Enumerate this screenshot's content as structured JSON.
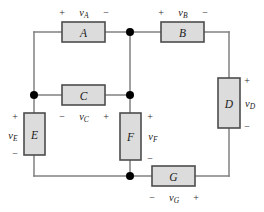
{
  "diagram": {
    "type": "circuit-schematic",
    "background_color": "#ffffff",
    "wire_color": "#808080",
    "box_fill_color": "#dcdcdc",
    "box_border_color": "#4d4d4d",
    "node_color": "#000000"
  },
  "elements": {
    "A": {
      "label": "A",
      "orientation": "horizontal",
      "voltage_symbol": "v",
      "voltage_subscript": "A",
      "voltage_label": "vA",
      "label_position": "above",
      "plus_sign": "+",
      "minus_sign": "−",
      "plus_side": "left",
      "minus_side": "right"
    },
    "B": {
      "label": "B",
      "orientation": "horizontal",
      "voltage_symbol": "v",
      "voltage_subscript": "B",
      "voltage_label": "vB",
      "label_position": "above",
      "plus_sign": "+",
      "minus_sign": "−",
      "plus_side": "left",
      "minus_side": "right"
    },
    "C": {
      "label": "C",
      "orientation": "horizontal",
      "voltage_symbol": "v",
      "voltage_subscript": "C",
      "voltage_label": "vC",
      "label_position": "below",
      "plus_sign": "+",
      "minus_sign": "−",
      "plus_side": "right",
      "minus_side": "left"
    },
    "D": {
      "label": "D",
      "orientation": "vertical",
      "voltage_symbol": "v",
      "voltage_subscript": "D",
      "voltage_label": "vD",
      "label_position": "right",
      "plus_sign": "+",
      "minus_sign": "−",
      "plus_side": "top",
      "minus_side": "bottom"
    },
    "E": {
      "label": "E",
      "orientation": "vertical",
      "voltage_symbol": "v",
      "voltage_subscript": "E",
      "voltage_label": "vE",
      "label_position": "left",
      "plus_sign": "+",
      "minus_sign": "−",
      "plus_side": "top",
      "minus_side": "bottom"
    },
    "F": {
      "label": "F",
      "orientation": "vertical",
      "voltage_symbol": "v",
      "voltage_subscript": "F",
      "voltage_label": "vF",
      "label_position": "right",
      "plus_sign": "+",
      "minus_sign": "−",
      "plus_side": "top",
      "minus_side": "bottom"
    },
    "G": {
      "label": "G",
      "orientation": "horizontal",
      "voltage_symbol": "v",
      "voltage_subscript": "G",
      "voltage_label": "vG",
      "label_position": "below",
      "plus_sign": "+",
      "minus_sign": "−",
      "plus_side": "right",
      "minus_side": "left"
    }
  },
  "nodes": [
    {
      "name": "node-top-center",
      "x": 130,
      "y": 32
    },
    {
      "name": "node-mid-left",
      "x": 34,
      "y": 95
    },
    {
      "name": "node-mid-center",
      "x": 130,
      "y": 95
    },
    {
      "name": "node-bottom-center",
      "x": 130,
      "y": 176
    }
  ]
}
